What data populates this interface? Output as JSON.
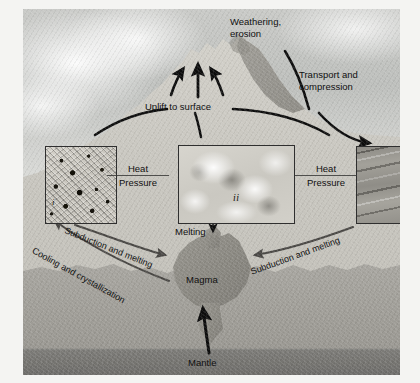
{
  "figure": {
    "type": "geology-process-diagram"
  },
  "labels": {
    "weathering_erosion": "Weathering,\nerosion",
    "transport_compression": "Transport and\ncompression",
    "uplift_to_surface": "Uplift to surface",
    "melting": "Melting",
    "magma": "Magma",
    "mantle": "Mantle",
    "subduction_left": "Subduction and melting",
    "subduction_right": "Subduction and melting",
    "cooling_crystallization": "Cooling and crystallization",
    "heat_left": "Heat",
    "pressure_left": "Pressure",
    "heat_right": "Heat",
    "pressure_right": "Pressure"
  },
  "insets": [
    {
      "id": "i",
      "roman": "i",
      "rock_type": "igneous",
      "texture": "speckled crystalline granite"
    },
    {
      "id": "ii",
      "roman": "ii",
      "rock_type": "metamorphic",
      "texture": "mottled cloudy marble"
    },
    {
      "id": "iii",
      "roman": "iii",
      "rock_type": "sedimentary",
      "texture": "diagonal banded strata"
    }
  ],
  "arrows": [
    {
      "name": "weathering-erosion-arrow",
      "style": "thick-black-curve"
    },
    {
      "name": "transport-compression-arrow",
      "style": "thick-black-curve"
    },
    {
      "name": "uplift-arrow-left",
      "style": "thick-black-straight"
    },
    {
      "name": "uplift-arrow-center",
      "style": "thick-black-straight"
    },
    {
      "name": "uplift-arrow-right",
      "style": "thick-black-straight"
    },
    {
      "name": "uplift-from-inset-i-arrow",
      "style": "thick-black-curve"
    },
    {
      "name": "uplift-from-inset-ii-arrow",
      "style": "thick-black-curve"
    },
    {
      "name": "uplift-from-inset-iii-arrow",
      "style": "thick-black-curve"
    },
    {
      "name": "melting-to-magma-arrow",
      "style": "thin-black-line"
    },
    {
      "name": "subduction-left-arrow",
      "style": "dark-gray-curve"
    },
    {
      "name": "subduction-right-arrow",
      "style": "dark-gray-curve"
    },
    {
      "name": "cooling-crystallization-arrow",
      "style": "dark-gray-curve"
    },
    {
      "name": "mantle-to-magma-arrow",
      "style": "thick-black-curve"
    }
  ],
  "scene": {
    "regions": [
      "sky",
      "mountain",
      "crust",
      "lithosphere",
      "mantle",
      "magma-chamber"
    ]
  },
  "colors": {
    "page_background": "#f2f2f0",
    "sky": "#c6c8c5",
    "crust": "#c8c6bf",
    "lithosphere": "#a2a09a",
    "mantle": "#76756f",
    "magma": "#8d8b84",
    "arrow_black": "#0d0d0d",
    "arrow_gray": "#4a4845",
    "inset_border": "#2f2f2f",
    "label_text": "#101010"
  }
}
